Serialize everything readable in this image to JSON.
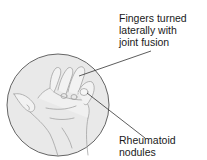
{
  "figure": {
    "background_color": "#ffffff",
    "circle_fill": "#e9e9e9",
    "circle_stroke": "#555555",
    "line_color": "#333333"
  },
  "callouts": [
    {
      "id": "fingers",
      "lines": [
        "Fingers turned",
        "laterally with",
        "joint fusion"
      ]
    },
    {
      "id": "nodules",
      "lines": [
        "Rheumatoid",
        "nodules"
      ]
    }
  ]
}
